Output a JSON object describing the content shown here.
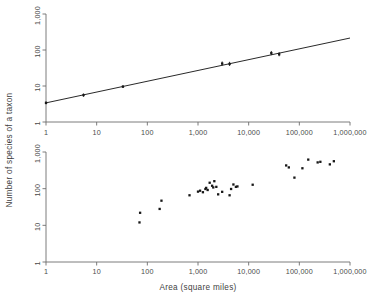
{
  "figure": {
    "axis_titles": {
      "x": "Area  (square miles)",
      "y": "Number of species of a taxon"
    },
    "x_tick_labels": [
      "1",
      "10",
      "100",
      "1,000",
      "10,000",
      "100,000",
      "1,000,000"
    ],
    "y_tick_labels": [
      "1",
      "10",
      "100",
      "1,000"
    ]
  },
  "chart_data": [
    {
      "type": "scatter",
      "panel": "top",
      "title": "",
      "xlabel": "Area  (square miles)",
      "ylabel": "Number of species of a taxon",
      "xscale": "log",
      "yscale": "log",
      "xlim": [
        1,
        1000000
      ],
      "ylim": [
        1,
        1000
      ],
      "xticks": [
        1,
        10,
        100,
        1000,
        10000,
        100000,
        1000000
      ],
      "yticks": [
        1,
        10,
        100,
        1000
      ],
      "xticklabels": [
        "1",
        "10",
        "100",
        "1,000",
        "10,000",
        "100,000",
        "1,000,000"
      ],
      "yticklabels": [
        "1",
        "10",
        "100",
        "1,000"
      ],
      "grid": false,
      "legend": "none",
      "points": [
        {
          "x": 1,
          "y": 3.4,
          "yerr_low": 3.1,
          "yerr_high": 3.7
        },
        {
          "x": 5.5,
          "y": 5.6,
          "yerr_low": 5.0,
          "yerr_high": 6.2
        },
        {
          "x": 33,
          "y": 9.6,
          "yerr_low": 8.8,
          "yerr_high": 10.5
        },
        {
          "x": 3000,
          "y": 42,
          "yerr_low": 37,
          "yerr_high": 48
        },
        {
          "x": 4200,
          "y": 41,
          "yerr_low": 36,
          "yerr_high": 47
        },
        {
          "x": 28000,
          "y": 82,
          "yerr_low": 72,
          "yerr_high": 94
        },
        {
          "x": 40000,
          "y": 76,
          "yerr_low": 67,
          "yerr_high": 87
        }
      ],
      "fit_line": {
        "label": "regression line",
        "x_start": 1,
        "y_start": 3.4,
        "x_end": 1000000,
        "y_end": 215
      }
    },
    {
      "type": "scatter",
      "panel": "bottom",
      "title": "",
      "xlabel": "Area  (square miles)",
      "ylabel": "Number of species of a taxon",
      "xscale": "log",
      "yscale": "log",
      "xlim": [
        1,
        1000000
      ],
      "ylim": [
        1,
        1000
      ],
      "xticks": [
        1,
        10,
        100,
        1000,
        10000,
        100000,
        1000000
      ],
      "yticks": [
        1,
        10,
        100,
        1000
      ],
      "xticklabels": [
        "1",
        "10",
        "100",
        "1,000",
        "10,000",
        "100,000",
        "1,000,000"
      ],
      "yticklabels": [
        "1",
        "10",
        "100",
        "1,000"
      ],
      "grid": false,
      "legend": "none",
      "points": [
        {
          "x": 70,
          "y": 12
        },
        {
          "x": 72,
          "y": 22
        },
        {
          "x": 175,
          "y": 28
        },
        {
          "x": 190,
          "y": 47
        },
        {
          "x": 680,
          "y": 66
        },
        {
          "x": 1000,
          "y": 83
        },
        {
          "x": 1100,
          "y": 88
        },
        {
          "x": 1250,
          "y": 80
        },
        {
          "x": 1400,
          "y": 98
        },
        {
          "x": 1450,
          "y": 105
        },
        {
          "x": 1550,
          "y": 92
        },
        {
          "x": 1700,
          "y": 145
        },
        {
          "x": 1900,
          "y": 120
        },
        {
          "x": 2000,
          "y": 108
        },
        {
          "x": 2100,
          "y": 160
        },
        {
          "x": 2300,
          "y": 112
        },
        {
          "x": 2500,
          "y": 70
        },
        {
          "x": 3000,
          "y": 82
        },
        {
          "x": 4200,
          "y": 66
        },
        {
          "x": 4500,
          "y": 98
        },
        {
          "x": 5000,
          "y": 130
        },
        {
          "x": 5600,
          "y": 112
        },
        {
          "x": 6000,
          "y": 115
        },
        {
          "x": 12000,
          "y": 128
        },
        {
          "x": 55000,
          "y": 430
        },
        {
          "x": 62000,
          "y": 380
        },
        {
          "x": 80000,
          "y": 200
        },
        {
          "x": 115000,
          "y": 360
        },
        {
          "x": 150000,
          "y": 620
        },
        {
          "x": 230000,
          "y": 520
        },
        {
          "x": 260000,
          "y": 540
        },
        {
          "x": 400000,
          "y": 460
        },
        {
          "x": 480000,
          "y": 560
        }
      ]
    }
  ]
}
